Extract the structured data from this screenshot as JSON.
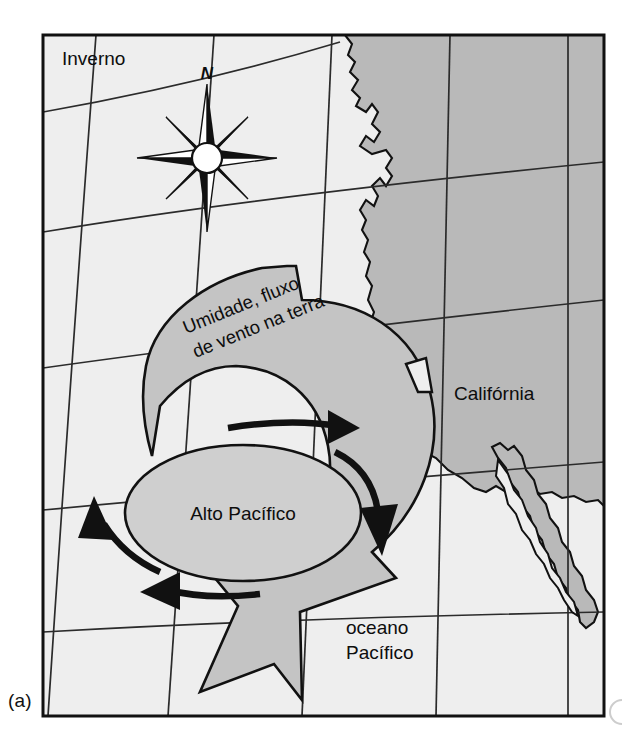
{
  "figure": {
    "panel_label": "(a)",
    "frame": {
      "x": 42,
      "y": 34,
      "width": 563,
      "height": 683
    }
  },
  "map": {
    "season_label": "Inverno",
    "compass": {
      "north_label": "N",
      "name": "compass-rose"
    },
    "labels": {
      "california": "Califórnia",
      "ocean_line1": "oceano",
      "ocean_line2": "Pacífico",
      "pacific_high": "Alto Pacífico",
      "flow_line1": "Umidade, fluxo",
      "flow_line2": "de vento na terra"
    },
    "colors": {
      "ocean_fill": "#eeeeee",
      "land_fill": "#b9b9b9",
      "arrow_fill": "#c4c4c4",
      "high_fill": "#cfcfcf",
      "stroke": "#111111",
      "graticule": "#2b2b2b",
      "page_background": "#ffffff"
    }
  }
}
